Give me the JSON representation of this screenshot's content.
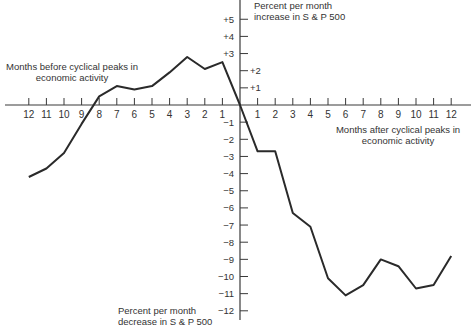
{
  "chart_data": {
    "type": "line",
    "title": "",
    "x_left_label": "Months before cyclical peaks in economic activity",
    "x_right_label": "Months after cyclical peaks in economic activity",
    "y_top_label": "Percent per month increase in S & P 500",
    "y_bottom_label": "Percent per month decrease in S & P 500",
    "xlabel": "Months relative to cyclical peak",
    "ylabel": "Percent per month change in S & P 500",
    "x_ticks_left": [
      "12",
      "11",
      "10",
      "9",
      "8",
      "7",
      "6",
      "5",
      "4",
      "3",
      "2",
      "1"
    ],
    "x_ticks_right": [
      "1",
      "2",
      "3",
      "4",
      "5",
      "6",
      "7",
      "8",
      "9",
      "10",
      "11",
      "12"
    ],
    "y_ticks_positive": [
      "+1",
      "+2",
      "+3",
      "+4",
      "+5"
    ],
    "y_ticks_negative": [
      "-1",
      "-2",
      "-3",
      "-4",
      "-5",
      "-6",
      "-7",
      "-8",
      "-9",
      "-10",
      "-11",
      "-12"
    ],
    "xlim": [
      -12,
      12
    ],
    "ylim": [
      -12,
      5
    ],
    "grid": false,
    "legend": null,
    "x": [
      -12,
      -11,
      -10,
      -9,
      -8,
      -7,
      -6,
      -5,
      -4,
      -3,
      -2,
      -1,
      0,
      1,
      2,
      3,
      4,
      5,
      6,
      7,
      8,
      9,
      10,
      11,
      12
    ],
    "series": [
      {
        "name": "S & P 500 percent change per month",
        "values": [
          -4.2,
          -3.7,
          -2.8,
          -1.1,
          0.5,
          1.1,
          0.9,
          1.1,
          1.9,
          2.8,
          2.1,
          2.5,
          0,
          -2.7,
          -2.7,
          -6.3,
          -7.1,
          -10.1,
          -11.1,
          -10.5,
          -9.0,
          -9.4,
          -10.7,
          -10.5,
          -8.8
        ]
      }
    ]
  },
  "labels": {
    "y_top_line1": "Percent per month",
    "y_top_line2": "increase in S & P 500",
    "y_bottom_line1": "Percent per month",
    "y_bottom_line2": "decrease in S & P 500",
    "x_left_line1": "Months before cyclical peaks in",
    "x_left_line2": "economic activity",
    "x_right_line1": "Months after cyclical peaks in",
    "x_right_line2": "economic activity"
  },
  "colors": {
    "line": "#2a2a2a",
    "axis": "#3a3a3a",
    "text": "#333333"
  }
}
